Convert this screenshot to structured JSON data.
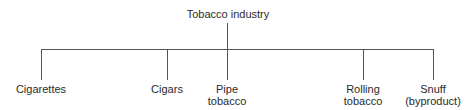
{
  "diagram": {
    "type": "tree",
    "root": {
      "label": "Tobacco industry"
    },
    "children": [
      {
        "line1": "Cigarettes",
        "line2": ""
      },
      {
        "line1": "Cigars",
        "line2": ""
      },
      {
        "line1": "Pipe",
        "line2": "tobacco"
      },
      {
        "line1": "Rolling",
        "line2": "tobacco"
      },
      {
        "line1": "Snuff",
        "line2": "(byproduct)"
      }
    ],
    "line_color": "#555555"
  }
}
